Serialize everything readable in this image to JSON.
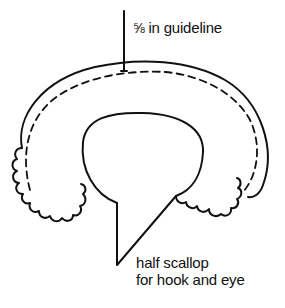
{
  "diagram": {
    "type": "sewing pattern illustration",
    "colors": {
      "line": "#111111",
      "background": "#ffffff"
    }
  },
  "labels": {
    "guideline": {
      "fraction": "⅝",
      "text": " in guideline"
    },
    "scallop": {
      "line1": "half scallop",
      "line2": "for hook and eye"
    }
  },
  "elements": [
    {
      "id": "outer-edge",
      "style": "solid",
      "description": "outer cutting edge of collar"
    },
    {
      "id": "seam-guideline",
      "style": "dashed",
      "description": "5/8 in guideline"
    },
    {
      "id": "neckline",
      "style": "solid",
      "description": "inner neck opening"
    },
    {
      "id": "scallops-left",
      "style": "solid",
      "description": "scalloped hem, left side"
    },
    {
      "id": "scallops-right",
      "style": "solid",
      "description": "scalloped hem, right side"
    },
    {
      "id": "leader-guideline",
      "style": "solid",
      "description": "leader line to guideline label"
    },
    {
      "id": "leader-scallop",
      "style": "solid",
      "description": "leader lines to half scallop label"
    }
  ]
}
